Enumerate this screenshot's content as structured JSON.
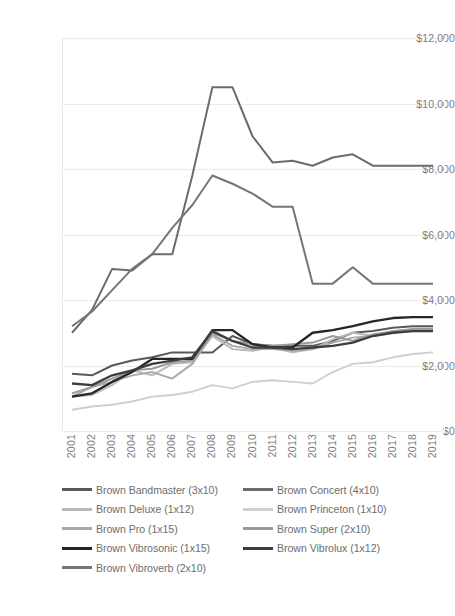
{
  "chart_data": {
    "type": "line",
    "title": "",
    "xlabel": "",
    "ylabel": "",
    "x": [
      2001,
      2002,
      2003,
      2004,
      2005,
      2006,
      2007,
      2008,
      2009,
      2010,
      2011,
      2012,
      2013,
      2014,
      2015,
      2016,
      2017,
      2018,
      2019
    ],
    "ylim": [
      0,
      12000
    ],
    "yticks": [
      0,
      2000,
      4000,
      6000,
      8000,
      10000,
      12000
    ],
    "ytick_labels": [
      "$0",
      "$2,000",
      "$4,000",
      "$6,000",
      "$8,000",
      "$10,000",
      "$12,000"
    ],
    "xtick_labels": [
      "2001",
      "2002",
      "2003",
      "2004",
      "2005",
      "2006",
      "2007",
      "2008",
      "2009",
      "2010",
      "2011",
      "2012",
      "2013",
      "2014",
      "2015",
      "2016",
      "2017",
      "2018",
      "2019"
    ],
    "grid": true,
    "legend_position": "bottom",
    "series": [
      {
        "name": "Brown Bandmaster (3x10)",
        "color": "#595959",
        "width": 2.0,
        "values": [
          1750,
          1700,
          2000,
          2150,
          2250,
          2400,
          2400,
          2400,
          2900,
          2650,
          2600,
          2600,
          2600,
          2750,
          3000,
          3050,
          3150,
          3200,
          3200
        ]
      },
      {
        "name": "Brown Concert (4x10)",
        "color": "#6b6b6b",
        "width": 2.0,
        "values": [
          3000,
          3700,
          4950,
          4900,
          5400,
          5400,
          7800,
          10500,
          10500,
          9000,
          8200,
          8250,
          8100,
          8350,
          8450,
          8100,
          8100,
          8100,
          8100
        ]
      },
      {
        "name": "Brown Deluxe (1x12)",
        "color": "#b9b9b9",
        "width": 1.9,
        "values": [
          1050,
          1100,
          1400,
          1850,
          1700,
          2050,
          2100,
          2900,
          2500,
          2450,
          2550,
          2400,
          2500,
          2800,
          3000,
          2900,
          3050,
          3100,
          3100
        ]
      },
      {
        "name": "Brown Princeton (1x10)",
        "color": "#cfcfcf",
        "width": 1.9,
        "values": [
          650,
          750,
          800,
          900,
          1050,
          1100,
          1200,
          1400,
          1300,
          1500,
          1550,
          1500,
          1450,
          1800,
          2050,
          2100,
          2250,
          2350,
          2400
        ]
      },
      {
        "name": "Brown Pro (1x15)",
        "color": "#a8a8a8",
        "width": 1.9,
        "values": [
          1050,
          1350,
          1500,
          1700,
          1800,
          1600,
          2050,
          2950,
          2600,
          2500,
          2500,
          2450,
          2500,
          2700,
          2850,
          2900,
          3000,
          3080,
          3100
        ]
      },
      {
        "name": "Brown Super (2x10)",
        "color": "#9a9a9a",
        "width": 1.9,
        "values": [
          1150,
          1350,
          1600,
          1850,
          1900,
          2100,
          2150,
          3000,
          2750,
          2650,
          2600,
          2650,
          2700,
          2900,
          2750,
          2950,
          3050,
          3120,
          3120
        ]
      },
      {
        "name": "Brown Vibrosonic (1x15)",
        "color": "#262626",
        "width": 2.3,
        "values": [
          1050,
          1150,
          1500,
          1800,
          2200,
          2200,
          2200,
          3080,
          3080,
          2650,
          2550,
          2550,
          3000,
          3080,
          3200,
          3350,
          3450,
          3480,
          3480
        ]
      },
      {
        "name": "Brown Vibrolux (1x12)",
        "color": "#3d3d3d",
        "width": 2.3,
        "values": [
          1450,
          1400,
          1700,
          1850,
          2050,
          2150,
          2250,
          3050,
          2750,
          2550,
          2550,
          2500,
          2550,
          2600,
          2700,
          2900,
          3000,
          3050,
          3050
        ]
      },
      {
        "name": "Brown Vibroverb (2x10)",
        "color": "#757575",
        "width": 2.0,
        "values": [
          3200,
          3650,
          4300,
          4950,
          5400,
          6200,
          6900,
          7800,
          7550,
          7250,
          6850,
          6850,
          4500,
          4500,
          5000,
          4500,
          4500,
          4500,
          4500
        ]
      }
    ]
  },
  "legend": {
    "rows": [
      [
        {
          "label": "Brown Bandmaster (3x10)",
          "color": "#595959",
          "thick": true
        },
        {
          "label": "Brown Concert (4x10)",
          "color": "#6b6b6b",
          "thick": true
        }
      ],
      [
        {
          "label": "Brown Deluxe (1x12)",
          "color": "#b9b9b9",
          "thick": false
        },
        {
          "label": "Brown Princeton (1x10)",
          "color": "#cfcfcf",
          "thick": false
        }
      ],
      [
        {
          "label": "Brown Pro (1x15)",
          "color": "#a8a8a8",
          "thick": false
        },
        {
          "label": "Brown Super (2x10)",
          "color": "#9a9a9a",
          "thick": false
        }
      ],
      [
        {
          "label": "Brown Vibrosonic (1x15)",
          "color": "#262626",
          "thick": true
        },
        {
          "label": "Brown Vibrolux (1x12)",
          "color": "#3d3d3d",
          "thick": true
        }
      ],
      [
        {
          "label": "Brown Vibroverb (2x10)",
          "color": "#757575",
          "thick": false
        }
      ]
    ]
  },
  "caption": {
    "text": ""
  }
}
